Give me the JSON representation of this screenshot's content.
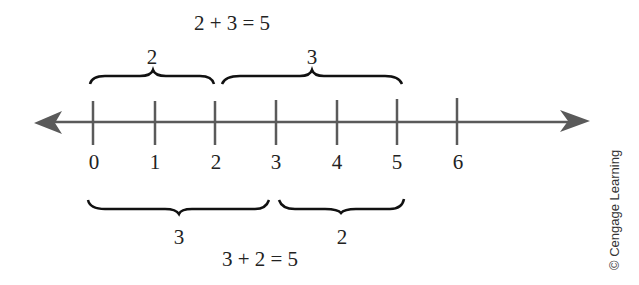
{
  "diagram": {
    "type": "number-line",
    "title_top": "2 + 3 = 5",
    "title_bottom": "3 + 2 = 5",
    "ticks": [
      "0",
      "1",
      "2",
      "3",
      "4",
      "5",
      "6"
    ],
    "top_braces": [
      {
        "label": "2",
        "from": 0,
        "to": 2
      },
      {
        "label": "3",
        "from": 2,
        "to": 5
      }
    ],
    "bottom_braces": [
      {
        "label": "3",
        "from": 0,
        "to": 3
      },
      {
        "label": "2",
        "from": 3,
        "to": 5
      }
    ],
    "credit": "© Cengage Learning",
    "colors": {
      "axis": "#5a5a5a",
      "brace": "#111111",
      "text": "#222222"
    }
  }
}
